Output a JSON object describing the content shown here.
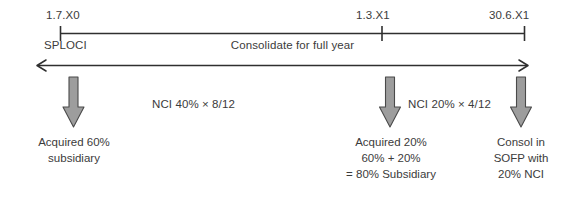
{
  "diagram": {
    "axis": {
      "dates": [
        {
          "label": "1.7.X0"
        },
        {
          "label": "1.3.X1"
        },
        {
          "label": "30.6.X1"
        }
      ],
      "under_left_label": "SPLOCI",
      "span_label": "Consolidate for full year"
    },
    "annotations": [
      {
        "text": "NCI 40% × 8/12"
      },
      {
        "text": "NCI 20% × 4/12"
      }
    ],
    "captions": [
      {
        "lines": [
          "Acquired 60%",
          "subsidiary"
        ]
      },
      {
        "lines": [
          "Acquired 20%",
          "60% + 20%",
          "= 80% Subsidiary"
        ]
      },
      {
        "lines": [
          "Consol in",
          "SOFP with",
          "20% NCI"
        ]
      }
    ],
    "colors": {
      "text": "#3b3b3b",
      "line": "#2f2f2f",
      "arrow_fill": "#9d9d9d",
      "arrow_stroke": "#4a4a4a",
      "background": "#ffffff"
    }
  }
}
